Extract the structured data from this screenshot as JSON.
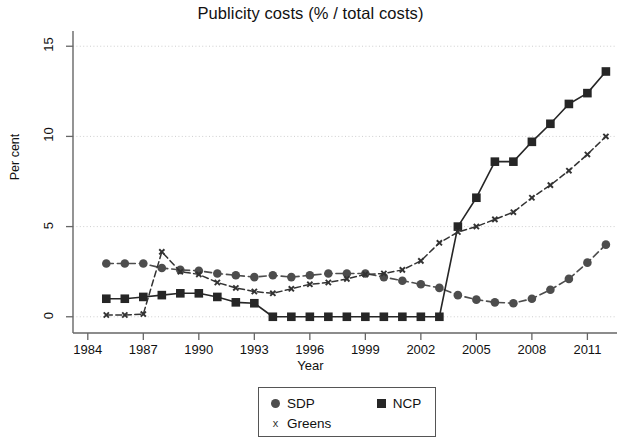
{
  "chart_data": {
    "type": "line",
    "title": "Publicity costs (% / total costs)",
    "xlabel": "Year",
    "ylabel": "Per cent",
    "xlim": [
      1983.2,
      2012.6
    ],
    "ylim": [
      -0.9,
      15.9
    ],
    "xticks": [
      1984,
      1987,
      1990,
      1993,
      1996,
      1999,
      2002,
      2005,
      2008,
      2011
    ],
    "yticks": [
      0,
      5,
      10,
      15
    ],
    "grid": "horizontal-dotted",
    "legend_position": "below-center",
    "series": [
      {
        "name": "SDP",
        "marker": "circle",
        "color": "#4d4d4d",
        "x": [
          1985,
          1986,
          1987,
          1988,
          1989,
          1990,
          1991,
          1992,
          1993,
          1994,
          1995,
          1996,
          1997,
          1998,
          1999,
          2000,
          2001,
          2002,
          2003,
          2004,
          2005,
          2006,
          2007,
          2008,
          2009,
          2010,
          2011,
          2012
        ],
        "y": [
          2.95,
          2.95,
          2.95,
          2.7,
          2.6,
          2.55,
          2.4,
          2.3,
          2.2,
          2.3,
          2.2,
          2.3,
          2.4,
          2.4,
          2.4,
          2.2,
          2.0,
          1.8,
          1.6,
          1.2,
          0.95,
          0.8,
          0.75,
          1.0,
          1.5,
          2.1,
          3.0,
          4.0
        ]
      },
      {
        "name": "NCP",
        "marker": "square",
        "color": "#262626",
        "x": [
          1985,
          1986,
          1987,
          1988,
          1989,
          1990,
          1991,
          1992,
          1993,
          1994,
          1995,
          1996,
          1997,
          1998,
          1999,
          2000,
          2001,
          2002,
          2003,
          2004,
          2005,
          2006,
          2007,
          2008,
          2009,
          2010,
          2011,
          2012
        ],
        "y": [
          1.0,
          1.0,
          1.1,
          1.2,
          1.3,
          1.3,
          1.1,
          0.8,
          0.75,
          0.0,
          0.0,
          0.0,
          0.0,
          0.0,
          0.0,
          0.0,
          0.0,
          0.0,
          0.0,
          5.0,
          6.6,
          8.6,
          8.6,
          9.7,
          10.7,
          11.8,
          12.4,
          13.6
        ]
      },
      {
        "name": "Greens",
        "marker": "x",
        "color": "#333333",
        "x": [
          1985,
          1986,
          1987,
          1988,
          1989,
          1990,
          1991,
          1992,
          1993,
          1994,
          1995,
          1996,
          1997,
          1998,
          1999,
          2000,
          2001,
          2002,
          2003,
          2004,
          2005,
          2006,
          2007,
          2008,
          2009,
          2010,
          2011,
          2012
        ],
        "y": [
          0.1,
          0.1,
          0.15,
          3.6,
          2.5,
          2.35,
          1.9,
          1.6,
          1.4,
          1.3,
          1.55,
          1.8,
          1.9,
          2.1,
          2.35,
          2.4,
          2.6,
          3.1,
          4.1,
          4.7,
          5.0,
          5.4,
          5.8,
          6.6,
          7.3,
          8.1,
          9.0,
          10.0
        ]
      }
    ]
  },
  "legend": {
    "items": [
      {
        "label": "SDP",
        "marker": "circle"
      },
      {
        "label": "NCP",
        "marker": "square"
      },
      {
        "label": "Greens",
        "marker": "x"
      }
    ]
  }
}
